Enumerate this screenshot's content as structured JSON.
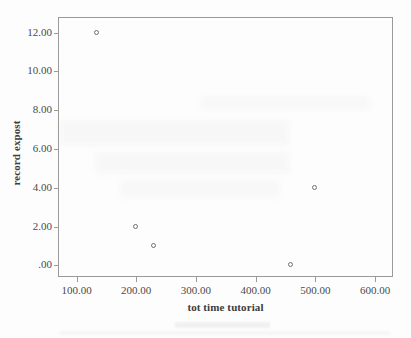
{
  "chart_data": {
    "type": "scatter",
    "title": "",
    "subtitle": "",
    "xlabel": "tot time tutorial",
    "ylabel": "record expost",
    "xlim": [
      69,
      630
    ],
    "ylim": [
      -0.6,
      12.8
    ],
    "xticks": [
      100,
      200,
      300,
      400,
      500,
      600
    ],
    "yticks": [
      0,
      2,
      4,
      6,
      8,
      10,
      12
    ],
    "xtick_labels": [
      "100.00",
      "200.00",
      "300.00",
      "400.00",
      "500.00",
      "600.00"
    ],
    "ytick_labels": [
      ".00",
      "2.00",
      "4.00",
      "6.00",
      "8.00",
      "10.00",
      "12.00"
    ],
    "grid": false,
    "legend": false,
    "legend_position": "none",
    "marker": "open-circle",
    "marker_color": "#6f6f6f",
    "frame_color": "#9a9a9a",
    "background_color": "#fdfdfd",
    "points": [
      {
        "x": 135,
        "y": 12,
        "label": "(135.00, 12.00)"
      },
      {
        "x": 200,
        "y": 2,
        "label": "(200.00, 2.00)"
      },
      {
        "x": 230,
        "y": 1,
        "label": "(230.00, 1.00)"
      },
      {
        "x": 460,
        "y": 0,
        "label": "(460.00, .00)"
      },
      {
        "x": 500,
        "y": 4,
        "label": "(500.00, 4.00)"
      }
    ],
    "series": [
      {
        "name": "record expost",
        "x": [
          135,
          200,
          230,
          460,
          500
        ],
        "values": [
          12,
          2,
          1,
          0,
          4
        ]
      }
    ]
  }
}
